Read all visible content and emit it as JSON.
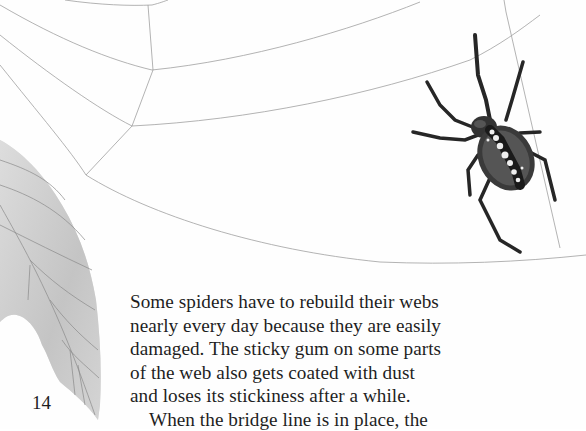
{
  "page": {
    "number": "14",
    "paragraphs": [
      {
        "lines": [
          "Some spiders have to rebuild their webs",
          "nearly every day because they are easily",
          "damaged. The sticky gum on some parts",
          "of the web also gets coated with dust",
          "and loses its stickiness after a while."
        ]
      },
      {
        "lines": [
          "When the bridge line is in place, the"
        ]
      }
    ]
  },
  "illustration": {
    "subject": "spider on web",
    "elements": [
      "spider-web",
      "orb-weaver-spider",
      "leaf"
    ],
    "colors": {
      "web_thread": "#9a9a9a",
      "spider_body": "#2a2a2a",
      "spider_markings": "#e8e8e8",
      "leaf": "#c9c9c9",
      "leaf_veins": "#7a7a7a",
      "text": "#1e1e1e"
    }
  }
}
